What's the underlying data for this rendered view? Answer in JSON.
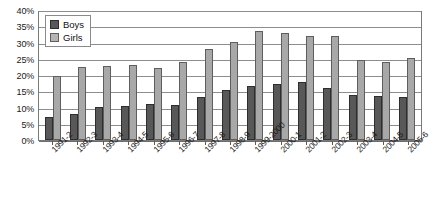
{
  "chart_data": {
    "type": "bar",
    "title": "",
    "subtitle": "",
    "xlabel": "",
    "ylabel": "",
    "ylim": [
      0,
      40
    ],
    "ytick_labels": [
      "40%",
      "35%",
      "30%",
      "25%",
      "20%",
      "15%",
      "10%",
      "5%",
      "0%"
    ],
    "ytick_values": [
      40,
      35,
      30,
      25,
      20,
      15,
      10,
      5,
      0
    ],
    "grid": true,
    "legend_position": "top-left-inside",
    "categories": [
      "1991-2",
      "1992-3",
      "1993-4",
      "1994-5",
      "1995-6",
      "1996-7",
      "1997-8",
      "1998-9",
      "1999-2000",
      "2000-1",
      "2001-2",
      "2002-3",
      "2003-4",
      "2004-5",
      "2005-6"
    ],
    "series": [
      {
        "name": "Boys",
        "color": "#585858",
        "values": [
          7,
          8,
          10.2,
          10.6,
          11,
          10.8,
          13.3,
          15.3,
          16.7,
          17.1,
          17.7,
          16.1,
          13.7,
          13.4,
          13.1
        ]
      },
      {
        "name": "Girls",
        "color": "#a8a8a8",
        "values": [
          19.8,
          22.4,
          22.7,
          23,
          22.1,
          23.9,
          28,
          30.3,
          33.6,
          33,
          32.1,
          31.9,
          24.7,
          24,
          25.3
        ]
      }
    ]
  },
  "legend": {
    "entries": [
      {
        "label": "Boys",
        "swatch": "boys"
      },
      {
        "label": "Girls",
        "swatch": "girls"
      }
    ]
  }
}
